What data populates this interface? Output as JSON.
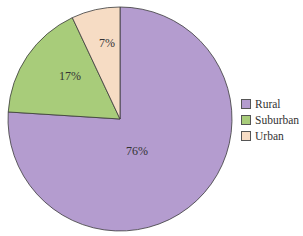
{
  "chart_data": {
    "type": "pie",
    "title": "",
    "categories": [
      "Rural",
      "Suburban",
      "Urban"
    ],
    "values": [
      76,
      17,
      7
    ],
    "labels": [
      "76%",
      "17%",
      "7%"
    ],
    "colors": [
      "#b49ccf",
      "#a8cc7a",
      "#f6dcc4"
    ],
    "legend_position": "right",
    "start_angle_deg": 0,
    "direction": "clockwise"
  },
  "legend": {
    "items": [
      {
        "label": "Rural",
        "color": "#b49ccf"
      },
      {
        "label": "Suburban",
        "color": "#a8cc7a"
      },
      {
        "label": "Urban",
        "color": "#f6dcc4"
      }
    ]
  }
}
